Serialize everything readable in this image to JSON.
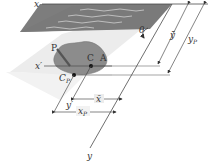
{
  "diagram": {
    "colors": {
      "liquid": "#7d7d7d",
      "liquid_waves": "#cfcfcf",
      "plate": "#ececec",
      "area": "#8c8c8c",
      "lines": "#4a4a4a",
      "background": "#ffffff"
    },
    "labels": {
      "x_axis": "x",
      "y_axis": "y",
      "x_prime": "x′",
      "y_prime": "y′",
      "theta": "θ",
      "force": "P",
      "centroid": "C",
      "area": "A",
      "center_of_pressure": "C",
      "center_of_pressure_sub": "P",
      "y_bar": "ȳ",
      "y_p": "y",
      "y_p_sub": "P",
      "x_bar": "x̄",
      "x_p": "x",
      "x_p_sub": "P"
    }
  }
}
